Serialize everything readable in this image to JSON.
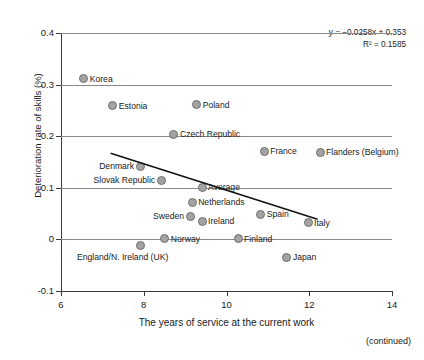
{
  "chart_data": {
    "type": "scatter",
    "title": "",
    "xlabel": "The years of service at the current work",
    "ylabel": "Deterioration rate of skills (%)",
    "xlim": [
      6,
      14
    ],
    "ylim": [
      -0.1,
      0.4
    ],
    "xticks": [
      "6",
      "8",
      "10",
      "12",
      "14"
    ],
    "yticks": [
      "0.4",
      "0.3",
      "0.2",
      "0.1",
      "0",
      "-0.1"
    ],
    "grid": "horizontal",
    "legend": "none",
    "annotations": {
      "equation": "y = −0.0258x + 0.353",
      "r_squared": "R² = 0.1585",
      "slope": -0.0258,
      "intercept": 0.353,
      "r2": 0.1585
    },
    "trendline": {
      "x_start": 7.2,
      "y_start": 0.167,
      "x_end": 12.2,
      "y_end": 0.039
    },
    "points": [
      {
        "label": "Korea",
        "x": 6.55,
        "y": 0.311,
        "label_pos": "right"
      },
      {
        "label": "Estonia",
        "x": 7.25,
        "y": 0.259,
        "label_pos": "right"
      },
      {
        "label": "Poland",
        "x": 9.28,
        "y": 0.261,
        "label_pos": "right"
      },
      {
        "label": "Czech Republic",
        "x": 8.73,
        "y": 0.204,
        "label_pos": "right"
      },
      {
        "label": "France",
        "x": 10.91,
        "y": 0.171,
        "label_pos": "right"
      },
      {
        "label": "Flanders (Belgium)",
        "x": 12.26,
        "y": 0.169,
        "label_pos": "right"
      },
      {
        "label": "Denmark",
        "x": 7.91,
        "y": 0.142,
        "label_pos": "left"
      },
      {
        "label": "Slovak Republic",
        "x": 8.42,
        "y": 0.115,
        "label_pos": "left"
      },
      {
        "label": "Average",
        "x": 9.41,
        "y": 0.101,
        "label_pos": "right"
      },
      {
        "label": "Netherlands",
        "x": 9.17,
        "y": 0.072,
        "label_pos": "right"
      },
      {
        "label": "Sweden",
        "x": 9.12,
        "y": 0.045,
        "label_pos": "left"
      },
      {
        "label": "Ireland",
        "x": 9.41,
        "y": 0.035,
        "label_pos": "right"
      },
      {
        "label": "Spain",
        "x": 10.83,
        "y": 0.049,
        "label_pos": "right"
      },
      {
        "label": "Italy",
        "x": 11.97,
        "y": 0.032,
        "label_pos": "right"
      },
      {
        "label": "Norway",
        "x": 8.51,
        "y": 0.001,
        "label_pos": "right"
      },
      {
        "label": "Finland",
        "x": 10.28,
        "y": 0.001,
        "label_pos": "right"
      },
      {
        "label": "England/N. Ireland (UK)",
        "x": 7.91,
        "y": -0.012,
        "label_pos": "below"
      },
      {
        "label": "Japan",
        "x": 11.46,
        "y": -0.035,
        "label_pos": "right"
      }
    ]
  },
  "footer": {
    "continued": "(continued)"
  },
  "colors": {
    "marker_fill": "#a3a3a3",
    "marker_stroke": "#6e6e6e",
    "gridline": "#8a8a8a",
    "axis": "#3a3a3a",
    "trendline": "#111111",
    "text": "#1a1a1a"
  }
}
